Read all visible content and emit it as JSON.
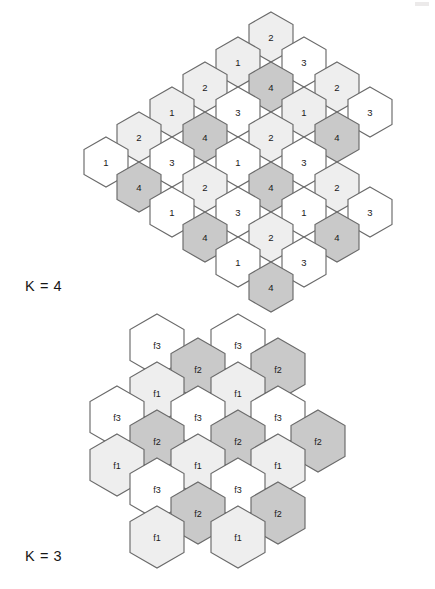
{
  "figure": {
    "background_color": "#ffffff",
    "stroke_color": "#6a6a6a"
  },
  "palette": {
    "white": "#ffffff",
    "light_gray": "#eeeeee",
    "mid_gray": "#c9c9c9"
  },
  "captions": {
    "top": "K = 4",
    "bottom": "K = 3"
  },
  "geometry": {
    "k4": {
      "hex_width": 44,
      "hex_height": 50,
      "col_pitch": 33,
      "row_pitch": 50,
      "row_offset": 25
    },
    "k3": {
      "hex_width": 54,
      "hex_height": 62,
      "col_pitch": 40.5,
      "row_pitch": 62,
      "row_offset": 31
    }
  },
  "diagrams": [
    {
      "name": "k4-cluster",
      "caption": "K = 4",
      "reuse_factor": 4,
      "cell_count": 33,
      "legend": {
        "1": "#eeeeee",
        "2": "#eeeeee",
        "3": "#ffffff",
        "4": "#c9c9c9"
      },
      "cells": [
        {
          "label": "2",
          "cx": 271,
          "cy": 37,
          "fill": "#eeeeee"
        },
        {
          "label": "1",
          "cx": 238,
          "cy": 62,
          "fill": "#eeeeee"
        },
        {
          "label": "3",
          "cx": 304,
          "cy": 62,
          "fill": "#ffffff"
        },
        {
          "label": "2",
          "cx": 205,
          "cy": 87,
          "fill": "#eeeeee"
        },
        {
          "label": "4",
          "cx": 271,
          "cy": 87,
          "fill": "#c9c9c9"
        },
        {
          "label": "2",
          "cx": 337,
          "cy": 87,
          "fill": "#eeeeee"
        },
        {
          "label": "1",
          "cx": 172,
          "cy": 112,
          "fill": "#eeeeee"
        },
        {
          "label": "3",
          "cx": 238,
          "cy": 112,
          "fill": "#ffffff"
        },
        {
          "label": "1",
          "cx": 304,
          "cy": 112,
          "fill": "#eeeeee"
        },
        {
          "label": "3",
          "cx": 370,
          "cy": 112,
          "fill": "#ffffff"
        },
        {
          "label": "2",
          "cx": 139,
          "cy": 137,
          "fill": "#eeeeee"
        },
        {
          "label": "4",
          "cx": 205,
          "cy": 137,
          "fill": "#c9c9c9"
        },
        {
          "label": "2",
          "cx": 271,
          "cy": 137,
          "fill": "#eeeeee"
        },
        {
          "label": "4",
          "cx": 337,
          "cy": 137,
          "fill": "#c9c9c9"
        },
        {
          "label": "1",
          "cx": 106,
          "cy": 162,
          "fill": "#ffffff"
        },
        {
          "label": "3",
          "cx": 172,
          "cy": 162,
          "fill": "#ffffff"
        },
        {
          "label": "1",
          "cx": 238,
          "cy": 162,
          "fill": "#ffffff"
        },
        {
          "label": "3",
          "cx": 304,
          "cy": 162,
          "fill": "#ffffff"
        },
        {
          "label": "4",
          "cx": 139,
          "cy": 187,
          "fill": "#c9c9c9"
        },
        {
          "label": "2",
          "cx": 205,
          "cy": 187,
          "fill": "#eeeeee"
        },
        {
          "label": "4",
          "cx": 271,
          "cy": 187,
          "fill": "#c9c9c9"
        },
        {
          "label": "2",
          "cx": 337,
          "cy": 187,
          "fill": "#eeeeee"
        },
        {
          "label": "1",
          "cx": 172,
          "cy": 212,
          "fill": "#ffffff"
        },
        {
          "label": "3",
          "cx": 238,
          "cy": 212,
          "fill": "#ffffff"
        },
        {
          "label": "1",
          "cx": 304,
          "cy": 212,
          "fill": "#ffffff"
        },
        {
          "label": "3",
          "cx": 370,
          "cy": 212,
          "fill": "#ffffff"
        },
        {
          "label": "4",
          "cx": 205,
          "cy": 237,
          "fill": "#c9c9c9"
        },
        {
          "label": "2",
          "cx": 271,
          "cy": 237,
          "fill": "#eeeeee"
        },
        {
          "label": "4",
          "cx": 337,
          "cy": 237,
          "fill": "#c9c9c9"
        },
        {
          "label": "1",
          "cx": 238,
          "cy": 262,
          "fill": "#ffffff"
        },
        {
          "label": "3",
          "cx": 304,
          "cy": 262,
          "fill": "#ffffff"
        },
        {
          "label": "4",
          "cx": 271,
          "cy": 287,
          "fill": "#c9c9c9"
        }
      ]
    },
    {
      "name": "k3-cluster",
      "caption": "K = 3",
      "reuse_factor": 3,
      "cell_count": 22,
      "legend": {
        "f1": "#eeeeee",
        "f2": "#c9c9c9",
        "f3": "#ffffff"
      },
      "cells": [
        {
          "label": "f3",
          "cx": 157,
          "cy": 345,
          "fill": "#ffffff"
        },
        {
          "label": "f3",
          "cx": 238,
          "cy": 345,
          "fill": "#ffffff"
        },
        {
          "label": "f2",
          "cx": 198,
          "cy": 369,
          "fill": "#c9c9c9"
        },
        {
          "label": "f2",
          "cx": 278,
          "cy": 369,
          "fill": "#c9c9c9"
        },
        {
          "label": "f1",
          "cx": 157,
          "cy": 393,
          "fill": "#eeeeee"
        },
        {
          "label": "f1",
          "cx": 238,
          "cy": 393,
          "fill": "#eeeeee"
        },
        {
          "label": "f3",
          "cx": 117,
          "cy": 417,
          "fill": "#ffffff"
        },
        {
          "label": "f3",
          "cx": 198,
          "cy": 417,
          "fill": "#ffffff"
        },
        {
          "label": "f3",
          "cx": 278,
          "cy": 417,
          "fill": "#ffffff"
        },
        {
          "label": "f2",
          "cx": 157,
          "cy": 441,
          "fill": "#c9c9c9"
        },
        {
          "label": "f2",
          "cx": 238,
          "cy": 441,
          "fill": "#c9c9c9"
        },
        {
          "label": "f2",
          "cx": 318,
          "cy": 441,
          "fill": "#c9c9c9"
        },
        {
          "label": "f1",
          "cx": 117,
          "cy": 465,
          "fill": "#eeeeee"
        },
        {
          "label": "f1",
          "cx": 198,
          "cy": 465,
          "fill": "#eeeeee"
        },
        {
          "label": "f1",
          "cx": 278,
          "cy": 465,
          "fill": "#eeeeee"
        },
        {
          "label": "f3",
          "cx": 157,
          "cy": 489,
          "fill": "#ffffff"
        },
        {
          "label": "f3",
          "cx": 238,
          "cy": 489,
          "fill": "#ffffff"
        },
        {
          "label": "f2",
          "cx": 198,
          "cy": 513,
          "fill": "#c9c9c9"
        },
        {
          "label": "f2",
          "cx": 278,
          "cy": 513,
          "fill": "#c9c9c9"
        },
        {
          "label": "f1",
          "cx": 157,
          "cy": 537,
          "fill": "#eeeeee"
        },
        {
          "label": "f1",
          "cx": 238,
          "cy": 537,
          "fill": "#eeeeee"
        }
      ]
    }
  ]
}
